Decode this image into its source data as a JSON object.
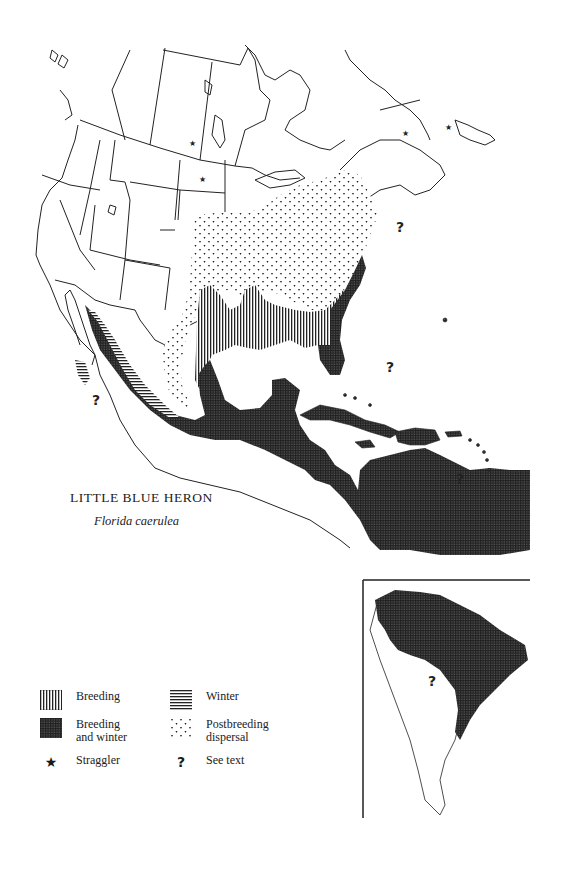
{
  "map": {
    "title": "LITTLE BLUE HERON",
    "scientific_name": "Florida caerulea",
    "regions": [
      "North America",
      "Central America",
      "Caribbean",
      "South America (inset)"
    ]
  },
  "legend": {
    "items": [
      {
        "key": "breeding",
        "label": "Breeding",
        "pattern": "vertical-lines"
      },
      {
        "key": "winter",
        "label": "Winter",
        "pattern": "horizontal-lines"
      },
      {
        "key": "breeding_winter",
        "label_line1": "Breeding",
        "label_line2": "and winter",
        "pattern": "crosshatch"
      },
      {
        "key": "postbreeding",
        "label_line1": "Postbreeding",
        "label_line2": "dispersal",
        "pattern": "dots"
      },
      {
        "key": "straggler",
        "label": "Straggler",
        "symbol": "★"
      },
      {
        "key": "see_text",
        "label": "See text",
        "symbol": "?"
      }
    ]
  },
  "markers": {
    "question": "?",
    "star": "★"
  },
  "colors": {
    "ink": "#1a1a1a",
    "paper": "#ffffff"
  }
}
